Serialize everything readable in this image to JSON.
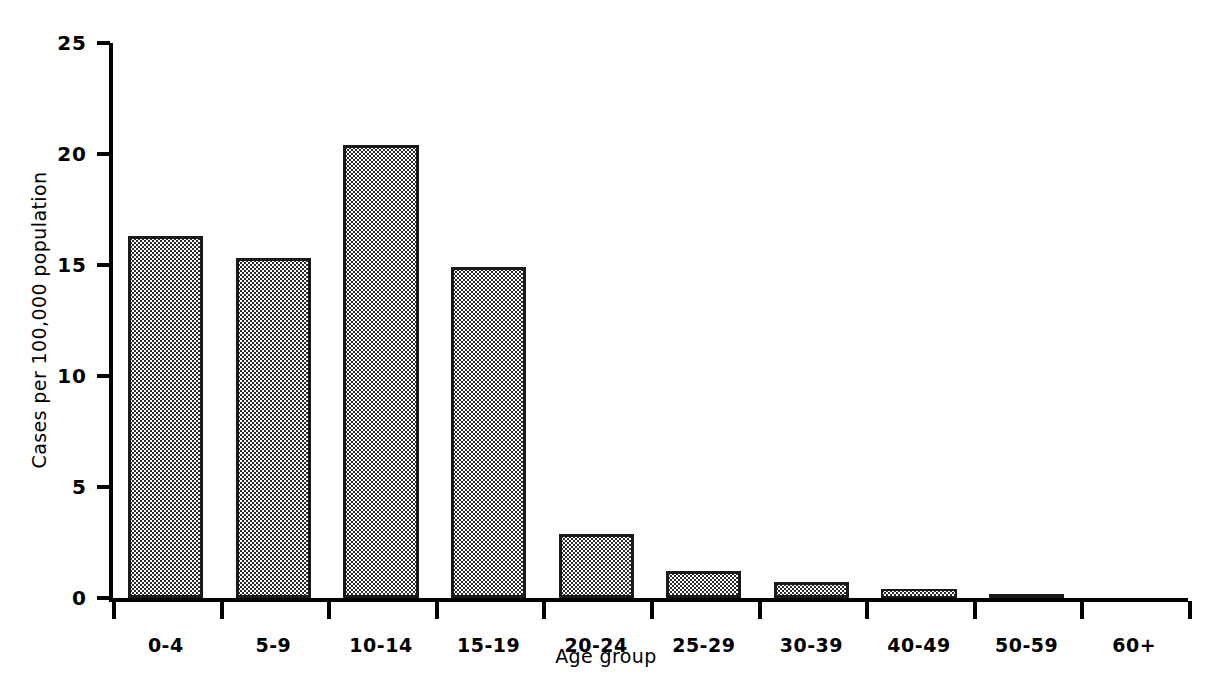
{
  "chart_data": {
    "type": "bar",
    "title": "",
    "xlabel": "Age group",
    "ylabel": "Cases per 100,000 population",
    "categories": [
      "0-4",
      "5-9",
      "10-14",
      "15-19",
      "20-24",
      "25-29",
      "30-39",
      "40-49",
      "50-59",
      "60+"
    ],
    "values": [
      16.3,
      15.3,
      20.4,
      14.9,
      2.9,
      1.2,
      0.7,
      0.4,
      0.2,
      0.0
    ],
    "ylim": [
      0,
      25
    ],
    "yticks": [
      0,
      5,
      10,
      15,
      20,
      25
    ],
    "ytick_labels": [
      "0",
      "5",
      "10",
      "15",
      "20",
      "25"
    ],
    "xlim_categories": 10,
    "grid": false,
    "legend": null,
    "bar_fill": "#ffffff",
    "bar_pattern": "halftone-dots",
    "bar_edge_color": "#1a1a1a",
    "axis_color": "#000000",
    "background": "#ffffff"
  }
}
